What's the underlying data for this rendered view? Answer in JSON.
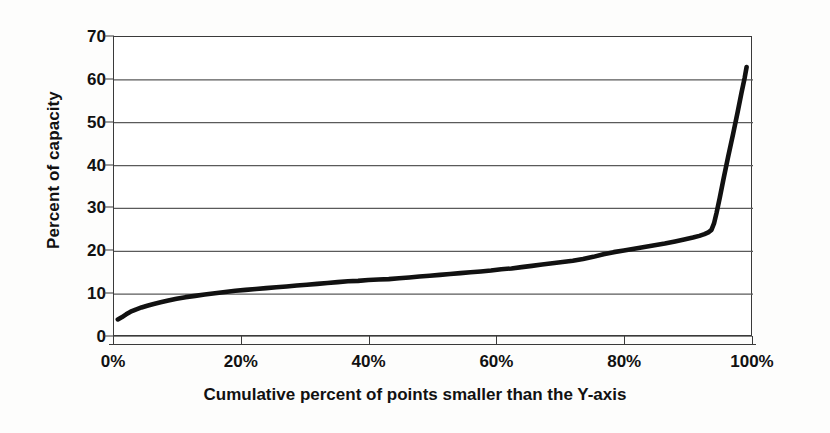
{
  "chart_data": {
    "type": "line",
    "title": "",
    "subtitle": "",
    "xlabel": "Cumulative percent of points smaller than the Y-axis",
    "ylabel": "Percent of capacity",
    "xlim": [
      0,
      100
    ],
    "ylim": [
      0,
      70
    ],
    "grid": "horizontal",
    "legend": "none",
    "xticklabels": [
      "0%",
      "20%",
      "40%",
      "60%",
      "80%",
      "100%"
    ],
    "xtickvalues": [
      0,
      20,
      40,
      60,
      80,
      100
    ],
    "yticklabels": [
      "0",
      "10",
      "20",
      "30",
      "40",
      "50",
      "60",
      "70"
    ],
    "ytickvalues": [
      0,
      10,
      20,
      30,
      40,
      50,
      60,
      70
    ],
    "series": [
      {
        "name": "Cumulative distribution of percent of capacity",
        "color": "#111111",
        "x": [
          0.6,
          1.2,
          1.9,
          2.6,
          3.4,
          4.3,
          5.2,
          6.2,
          7.3,
          8.5,
          9.8,
          11.2,
          12.7,
          14.2,
          15.8,
          17.4,
          19.0,
          20.6,
          22.2,
          23.8,
          25.4,
          27.0,
          28.6,
          30.2,
          31.8,
          33.4,
          35.0,
          36.6,
          38.2,
          39.8,
          41.4,
          43.0,
          44.6,
          46.2,
          47.8,
          49.4,
          51.0,
          52.6,
          54.2,
          55.8,
          57.4,
          59.0,
          60.6,
          62.2,
          63.8,
          65.4,
          67.0,
          68.6,
          70.2,
          71.8,
          73.4,
          75.0,
          76.6,
          78.2,
          79.8,
          81.4,
          83.0,
          84.6,
          86.2,
          87.8,
          89.4,
          90.6,
          91.6,
          92.4,
          93.0,
          93.5,
          93.9,
          94.3,
          94.8,
          95.4,
          96.1,
          96.9,
          97.6,
          98.2,
          98.7,
          99.0
        ],
        "y": [
          4.1,
          4.6,
          5.3,
          5.9,
          6.4,
          6.9,
          7.3,
          7.7,
          8.1,
          8.5,
          8.9,
          9.3,
          9.6,
          9.9,
          10.2,
          10.5,
          10.8,
          11.0,
          11.2,
          11.4,
          11.6,
          11.8,
          12.0,
          12.2,
          12.4,
          12.6,
          12.8,
          13.0,
          13.1,
          13.3,
          13.4,
          13.5,
          13.7,
          13.9,
          14.1,
          14.3,
          14.5,
          14.7,
          14.9,
          15.1,
          15.3,
          15.5,
          15.8,
          16.0,
          16.3,
          16.6,
          16.9,
          17.2,
          17.5,
          17.8,
          18.2,
          18.7,
          19.3,
          19.8,
          20.2,
          20.6,
          21.0,
          21.4,
          21.8,
          22.3,
          22.8,
          23.2,
          23.6,
          24.0,
          24.4,
          25.0,
          26.5,
          29.0,
          32.5,
          37.0,
          42.0,
          47.5,
          52.5,
          57.0,
          60.5,
          63.0
        ]
      }
    ]
  },
  "axes": {
    "ylabel": "Percent of capacity",
    "xlabel": "Cumulative percent of points smaller than the Y-axis"
  },
  "style": {
    "line_color": "#111111",
    "grid_color": "#5a5a5a",
    "frame_color": "#3a3a3a",
    "background": "#ffffff"
  }
}
